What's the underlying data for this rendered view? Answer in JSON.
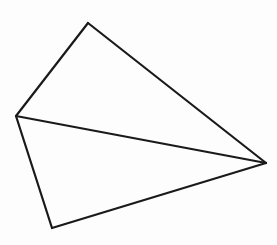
{
  "canvas": {
    "width": 277,
    "height": 245,
    "background_color": "#fdfdfd",
    "title": "Geometric line drawing"
  },
  "style": {
    "stroke_color": "#1a1a1a",
    "stroke_width": 2.2,
    "fill_color": "none",
    "line_cap": "round"
  },
  "figure": {
    "name": "quadrilateral-with-diagonal",
    "shape_type": "quadrilateral",
    "vertex_count": 4,
    "edge_count": 5,
    "face_count": 2
  },
  "vertices": [
    {
      "id": "A",
      "role": "top-apex",
      "x": 88,
      "y": 23
    },
    {
      "id": "B",
      "role": "right-apex",
      "x": 266,
      "y": 163
    },
    {
      "id": "C",
      "role": "bottom-apex",
      "x": 52,
      "y": 228
    },
    {
      "id": "D",
      "role": "left-apex",
      "x": 16,
      "y": 116
    }
  ],
  "edges": [
    {
      "id": "AB",
      "name": "upper-right-edge",
      "from": "A",
      "to": "B",
      "kind": "outline",
      "x1": 88,
      "y1": 23,
      "x2": 266,
      "y2": 163
    },
    {
      "id": "BC",
      "name": "lower-right-edge",
      "from": "B",
      "to": "C",
      "kind": "outline",
      "x1": 266,
      "y1": 163,
      "x2": 52,
      "y2": 228
    },
    {
      "id": "CD",
      "name": "lower-left-edge",
      "from": "C",
      "to": "D",
      "kind": "outline",
      "x1": 52,
      "y1": 228,
      "x2": 16,
      "y2": 116
    },
    {
      "id": "DA",
      "name": "upper-left-edge",
      "from": "D",
      "to": "A",
      "kind": "outline",
      "x1": 16,
      "y1": 116,
      "x2": 88,
      "y2": 23
    },
    {
      "id": "DB",
      "name": "internal-diagonal",
      "from": "D",
      "to": "B",
      "kind": "diagonal",
      "x1": 16,
      "y1": 116,
      "x2": 266,
      "y2": 163
    }
  ],
  "faces": [
    {
      "id": "ADB",
      "name": "upper-triangle",
      "vertices": [
        "A",
        "D",
        "B"
      ],
      "points": "88,23 16,116 266,163"
    },
    {
      "id": "DCB",
      "name": "lower-triangle",
      "vertices": [
        "D",
        "C",
        "B"
      ],
      "points": "16,116 52,228 266,163"
    }
  ],
  "labels": []
}
